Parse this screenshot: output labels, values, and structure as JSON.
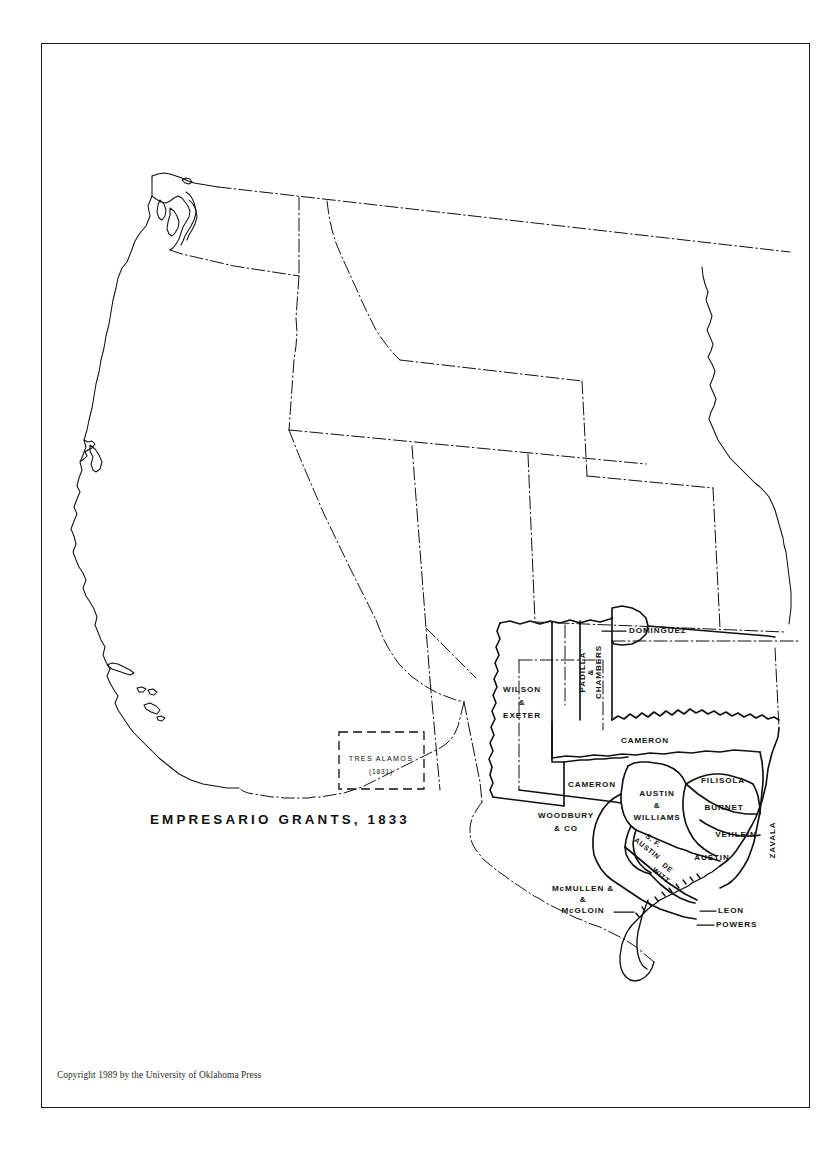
{
  "plate": {
    "title": "EMPRESARIO GRANTS, 1833",
    "copyright": "Copyright 1989 by the University of Oklahoma Press",
    "background_color": "#ffffff",
    "line_color": "#111111",
    "frame_color": "#1a1a1a"
  },
  "map": {
    "region": "Western United States",
    "grants": [
      {
        "id": "dominguez",
        "label": "DOMINGUEZ",
        "leader": true,
        "rotated": false
      },
      {
        "id": "padilla-chambers",
        "label_line1": "PADILLA",
        "label_line2": "&",
        "label_line3": "CHAMBERS",
        "rotated": true
      },
      {
        "id": "wilson-exeter",
        "label_line1": "WILSON",
        "label_line2": "&",
        "label_line3": "EXETER",
        "rotated": false
      },
      {
        "id": "cameron-north",
        "label": "CAMERON",
        "rotated": false
      },
      {
        "id": "cameron-west",
        "label": "CAMERON",
        "rotated": false
      },
      {
        "id": "filisola",
        "label": "FILISOLA",
        "rotated": false
      },
      {
        "id": "burnet",
        "label": "BURNET",
        "rotated": false
      },
      {
        "id": "zavala",
        "label": "ZAVALA",
        "rotated": true
      },
      {
        "id": "vehlein",
        "label": "VEHLEIN",
        "rotated": false
      },
      {
        "id": "austin-williams",
        "label_line1": "AUSTIN",
        "label_line2": "&",
        "label_line3": "WILLIAMS",
        "rotated": false
      },
      {
        "id": "sf-austin",
        "label_line1": "S. F.",
        "label_line2": "AUSTIN",
        "rotated": true
      },
      {
        "id": "de-witt",
        "label_line1": "DE",
        "label_line2": "WITT",
        "rotated": true
      },
      {
        "id": "austin",
        "label": "AUSTIN",
        "rotated": false
      },
      {
        "id": "woodbury-co",
        "label_line1": "WOODBURY",
        "label_line2": "& CO",
        "rotated": false
      },
      {
        "id": "mcmullen-mcgloin",
        "label_line1": "McMULLEN  &",
        "label_line2": "&",
        "label_line3": "McGLOIN",
        "rotated": false
      },
      {
        "id": "leon",
        "label": "LEON",
        "leader": true,
        "rotated": false
      },
      {
        "id": "powers",
        "label": "POWERS",
        "leader": true,
        "rotated": false
      },
      {
        "id": "tres-alamos",
        "label": "TRES  ALAMOS",
        "year": "(1831)",
        "dashed_box": true,
        "rotated": false
      }
    ]
  }
}
